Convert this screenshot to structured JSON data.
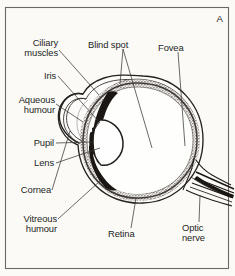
{
  "figure": {
    "panel_letter": "A",
    "background_color": "#fbfaf7",
    "ink_color": "#231f1d",
    "frame": {
      "color": "#6b6862",
      "x": 5,
      "y": 7,
      "width": 224,
      "height": 262
    }
  },
  "labels": {
    "ciliary_muscles": "Ciliary\nmuscles",
    "iris": "Iris",
    "aqueous_humour": "Aqueous\nhumour",
    "pupil": "Pupil",
    "lens": "Lens",
    "cornea": "Cornea",
    "vitreous_humour": "Vitreous\nhumour",
    "blind_spot": "Blind spot",
    "fovea": "Fovea",
    "retina": "Retina",
    "optic_nerve": "Optic\nnerve"
  },
  "structures": [
    {
      "name": "sclera",
      "description": "outer white fibrous coat of the eyeball"
    },
    {
      "name": "choroid",
      "description": "dark vascular middle layer"
    },
    {
      "name": "retina",
      "description": "stippled inner light-sensitive layer"
    },
    {
      "name": "cornea",
      "description": "transparent bulge at the front of the eye"
    },
    {
      "name": "anterior-chamber",
      "description": "aqueous humour space behind cornea"
    },
    {
      "name": "iris",
      "description": "dark wedge forming the pupil aperture"
    },
    {
      "name": "lens",
      "description": "biconvex transparent body behind the pupil"
    },
    {
      "name": "ciliary-body",
      "description": "muscular ring supporting the lens"
    },
    {
      "name": "vitreous-chamber",
      "description": "large cavity filled with vitreous humour"
    },
    {
      "name": "optic-disc",
      "description": "blind spot where nerve fibres leave"
    },
    {
      "name": "fovea",
      "description": "area of sharpest vision on the retina"
    },
    {
      "name": "optic-nerve",
      "description": "nerve bundle leaving the rear of the eye"
    }
  ]
}
